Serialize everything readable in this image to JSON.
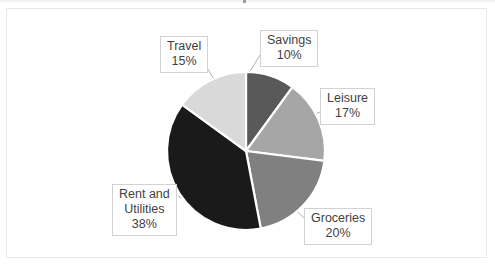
{
  "canvas": {
    "width": 495,
    "height": 268,
    "background": "#ffffff",
    "frame_border_color": "#e8e8e8"
  },
  "chart_data": {
    "type": "pie",
    "title": "",
    "subtitle": "",
    "xlabel": "",
    "ylabel": "",
    "legend_position": "none",
    "grid": false,
    "labels_format": "category + percent",
    "start_angle_deg": 0,
    "direction": "clockwise",
    "categories": [
      "Savings",
      "Leisure",
      "Groceries",
      "Rent and Utilities",
      "Travel"
    ],
    "values": [
      10,
      17,
      20,
      38,
      15
    ],
    "units": "percent",
    "colors": [
      "#595959",
      "#a6a6a6",
      "#808080",
      "#1a1a1a",
      "#d9d9d9"
    ],
    "slice_border_color": "#ffffff",
    "slices": [
      {
        "name": "Savings",
        "value": 10,
        "percent_text": "10%",
        "color": "#595959"
      },
      {
        "name": "Leisure",
        "value": 17,
        "percent_text": "17%",
        "color": "#a6a6a6"
      },
      {
        "name": "Groceries",
        "value": 20,
        "percent_text": "20%",
        "color": "#808080"
      },
      {
        "name": "Rent and Utilities",
        "value": 38,
        "percent_text": "38%",
        "color": "#1a1a1a"
      },
      {
        "name": "Travel",
        "value": 15,
        "percent_text": "15%",
        "color": "#d9d9d9"
      }
    ]
  },
  "labels": {
    "savings": {
      "name": "Savings",
      "percent": "10%"
    },
    "leisure": {
      "name": "Leisure",
      "percent": "17%"
    },
    "groceries": {
      "name": "Groceries",
      "percent": "20%"
    },
    "rent": {
      "name_line1": "Rent and",
      "name_line2": "Utilities",
      "percent": "38%"
    },
    "travel": {
      "name": "Travel",
      "percent": "15%"
    }
  }
}
